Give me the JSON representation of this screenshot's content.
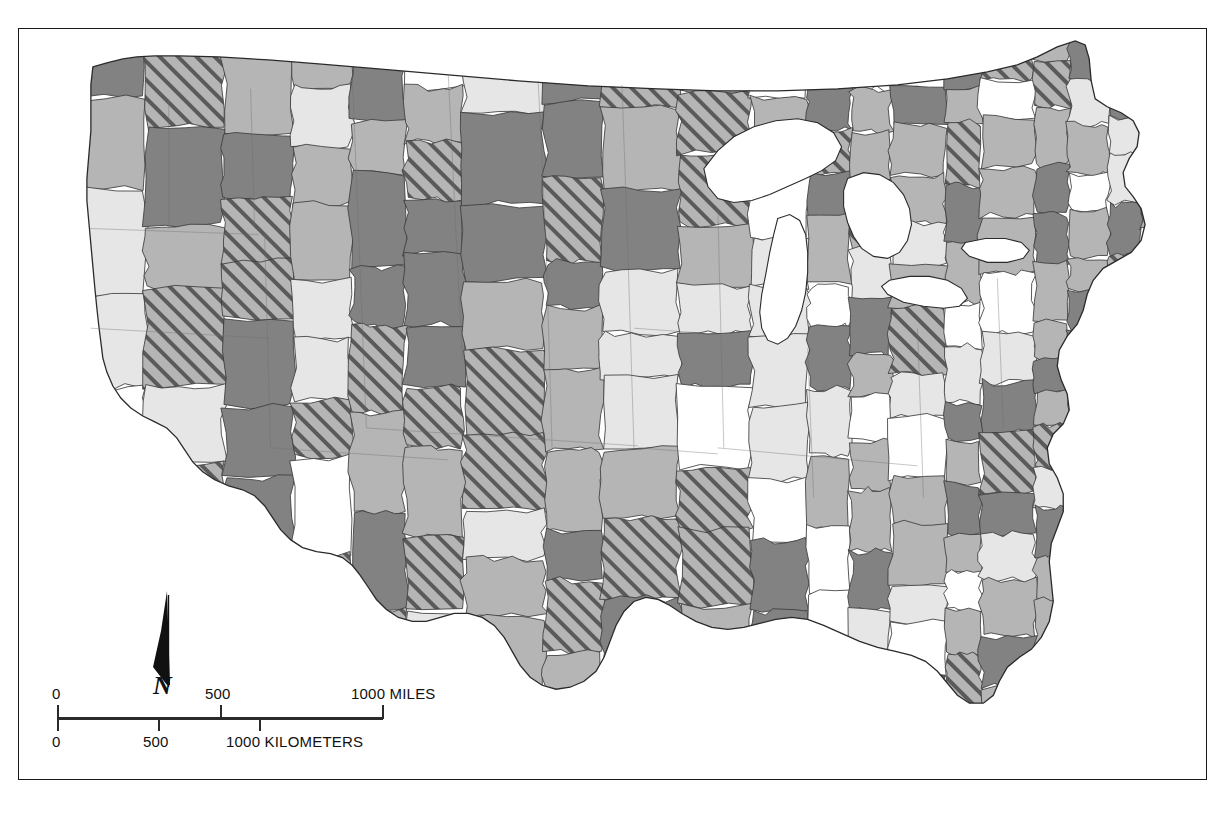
{
  "map": {
    "title": "United States multi-county economic areas choropleth map",
    "region_name": "Conterminous United States",
    "projection_note": "Albers equal-area conic",
    "frame_color": "#1a1a1a",
    "background_color": "#ffffff",
    "water_color": "#ffffff",
    "boundary_color": "#3c3c3c",
    "state_boundary_color": "#2a2a2a"
  },
  "shading_classes": [
    {
      "id": "class-white",
      "name": "lowest",
      "fill": "#ffffff",
      "pattern": "solid"
    },
    {
      "id": "class-light",
      "name": "low",
      "fill": "#e6e6e6",
      "pattern": "solid"
    },
    {
      "id": "class-medium",
      "name": "medium",
      "fill": "#b5b5b5",
      "pattern": "solid"
    },
    {
      "id": "class-dark",
      "name": "high",
      "fill": "#828282",
      "pattern": "solid"
    },
    {
      "id": "class-hatch",
      "name": "highest",
      "fill": "#b5b5b5",
      "pattern": "diagonal-hatch",
      "hatch_color": "#5a5a5a",
      "hatch_angle_deg": 45,
      "hatch_spacing_px": 13,
      "hatch_width_px": 4
    }
  ],
  "scalebar": {
    "miles": {
      "unit_label": "1000 MILES",
      "ticks": [
        {
          "label": "0",
          "value": 0
        },
        {
          "label": "500",
          "value": 500
        },
        {
          "label": "1000",
          "value": 1000
        }
      ]
    },
    "kilometers": {
      "unit_label": "1000 KILOMETERS",
      "ticks": [
        {
          "label": "0",
          "value": 0
        },
        {
          "label": "500",
          "value": 500
        },
        {
          "label": "1000",
          "value": 1000
        }
      ]
    }
  },
  "north_arrow": {
    "label": "N"
  },
  "chart_data": {
    "type": "heatmap",
    "xlabel": "",
    "ylabel": "",
    "legend_position": "none",
    "grid": false,
    "categories": [
      "lowest",
      "low",
      "medium",
      "high",
      "highest"
    ],
    "values": [
      38,
      92,
      118,
      96,
      64
    ]
  }
}
